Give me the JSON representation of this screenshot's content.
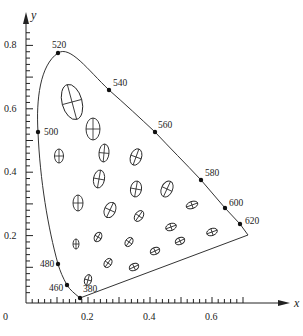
{
  "chart_data": {
    "type": "scatter",
    "title": "",
    "subtitle": "",
    "xlabel": "x",
    "ylabel": "y",
    "xlim": [
      0,
      0.75
    ],
    "ylim": [
      0,
      0.85
    ],
    "grid": false,
    "legend": null,
    "x_ticks": [
      {
        "value": 0.2,
        "label": "0.2"
      },
      {
        "value": 0.4,
        "label": "0.4"
      },
      {
        "value": 0.6,
        "label": "0.6"
      }
    ],
    "y_ticks": [
      {
        "value": 0.2,
        "label": "0.2"
      },
      {
        "value": 0.4,
        "label": "0.4"
      },
      {
        "value": 0.6,
        "label": "0.6"
      },
      {
        "value": 0.8,
        "label": "0.8"
      }
    ],
    "origin_label": "0",
    "spectral_locus_points": [
      {
        "nm": "380",
        "x": 0.17,
        "y": 0.005
      },
      {
        "nm": "460",
        "x": 0.14,
        "y": 0.04
      },
      {
        "nm": "480",
        "x": 0.09,
        "y": 0.13
      },
      {
        "nm": "500",
        "x": 0.01,
        "y": 0.54
      },
      {
        "nm": "520",
        "x": 0.07,
        "y": 0.83
      },
      {
        "nm": "540",
        "x": 0.23,
        "y": 0.75
      },
      {
        "nm": "560",
        "x": 0.37,
        "y": 0.62
      },
      {
        "nm": "580",
        "x": 0.51,
        "y": 0.49
      },
      {
        "nm": "600",
        "x": 0.63,
        "y": 0.37
      },
      {
        "nm": "620",
        "x": 0.69,
        "y": 0.31
      }
    ],
    "macadam_ellipses": [
      {
        "cx": 0.16,
        "cy": 0.63,
        "rx": 10,
        "ry": 18,
        "rot": -15
      },
      {
        "cx": 0.22,
        "cy": 0.55,
        "rx": 7,
        "ry": 11,
        "rot": 0
      },
      {
        "cx": 0.25,
        "cy": 0.46,
        "rx": 5,
        "ry": 9,
        "rot": 5
      },
      {
        "cx": 0.11,
        "cy": 0.45,
        "rx": 4.5,
        "ry": 7,
        "rot": 0
      },
      {
        "cx": 0.35,
        "cy": 0.45,
        "rx": 5.5,
        "ry": 8.5,
        "rot": 20
      },
      {
        "cx": 0.24,
        "cy": 0.38,
        "rx": 5.5,
        "ry": 9,
        "rot": 10
      },
      {
        "cx": 0.35,
        "cy": 0.35,
        "rx": 5.5,
        "ry": 8,
        "rot": 10
      },
      {
        "cx": 0.45,
        "cy": 0.35,
        "rx": 5.5,
        "ry": 8.5,
        "rot": 25
      },
      {
        "cx": 0.17,
        "cy": 0.3,
        "rx": 5,
        "ry": 8,
        "rot": 0
      },
      {
        "cx": 0.27,
        "cy": 0.28,
        "rx": 5.5,
        "ry": 8,
        "rot": 25
      },
      {
        "cx": 0.37,
        "cy": 0.26,
        "rx": 4,
        "ry": 6,
        "rot": 35
      },
      {
        "cx": 0.54,
        "cy": 0.3,
        "rx": 6,
        "ry": 3.5,
        "rot": -20
      },
      {
        "cx": 0.16,
        "cy": 0.17,
        "rx": 3,
        "ry": 5,
        "rot": 0
      },
      {
        "cx": 0.23,
        "cy": 0.19,
        "rx": 3.5,
        "ry": 5,
        "rot": 30
      },
      {
        "cx": 0.33,
        "cy": 0.18,
        "rx": 3.5,
        "ry": 5,
        "rot": 35
      },
      {
        "cx": 0.47,
        "cy": 0.23,
        "rx": 5.5,
        "ry": 3.5,
        "rot": -20
      },
      {
        "cx": 0.5,
        "cy": 0.18,
        "rx": 5,
        "ry": 3.5,
        "rot": -25
      },
      {
        "cx": 0.6,
        "cy": 0.21,
        "rx": 5.5,
        "ry": 3.5,
        "rot": -20
      },
      {
        "cx": 0.42,
        "cy": 0.15,
        "rx": 5,
        "ry": 3.5,
        "rot": -25
      },
      {
        "cx": 0.26,
        "cy": 0.11,
        "rx": 3.5,
        "ry": 5,
        "rot": 35
      },
      {
        "cx": 0.35,
        "cy": 0.1,
        "rx": 5,
        "ry": 3.5,
        "rot": -25
      },
      {
        "cx": 0.2,
        "cy": 0.06,
        "rx": 3.5,
        "ry": 5.5,
        "rot": 15
      }
    ],
    "annotations": [
      "380",
      "460",
      "480",
      "500",
      "520",
      "540",
      "560",
      "580",
      "600",
      "620"
    ]
  }
}
